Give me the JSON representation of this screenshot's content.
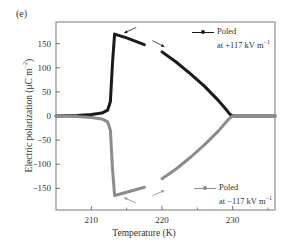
{
  "panel_label": "(e)",
  "chart_data": {
    "type": "line",
    "title": "",
    "xlabel": "Temperature (K)",
    "ylabel": "Electric polarization (μC m⁻²)",
    "xlim": [
      205,
      236
    ],
    "ylim": [
      -195,
      195
    ],
    "xticks": [
      210,
      220,
      230
    ],
    "xticks_minor": [
      215,
      225,
      235
    ],
    "yticks": [
      -150,
      -100,
      -50,
      0,
      50,
      100,
      150
    ],
    "grid": false,
    "legend_position": "inside-right",
    "series": [
      {
        "name": "Poled at +117 kV m⁻¹",
        "color": "#1a1a1a",
        "segments": [
          {
            "label": "cooling (leftward arrow)",
            "x": [
              205,
              208,
              210,
              211.5,
              212.3,
              212.7,
              213.0,
              213.3,
              215,
              217.5
            ],
            "y": [
              0,
              1,
              3,
              6,
              12,
              30,
              110,
              170,
              162,
              148
            ]
          },
          {
            "label": "heating (rightward arrow)",
            "x": [
              220,
              222,
              224,
              226,
              228,
              229,
              229.6,
              230,
              232,
              236
            ],
            "y": [
              133,
              112,
              88,
              62,
              32,
              15,
              4,
              0,
              0,
              0
            ]
          }
        ]
      },
      {
        "name": "Poled at −117 kV m⁻¹",
        "color": "#8c8c8c",
        "segments": [
          {
            "label": "cooling (leftward arrow)",
            "x": [
              205,
              208,
              210,
              211.5,
              212.3,
              212.7,
              213.0,
              213.3,
              215,
              217.5
            ],
            "y": [
              0,
              -1,
              -3,
              -6,
              -12,
              -30,
              -110,
              -165,
              -158,
              -148
            ]
          },
          {
            "label": "heating (rightward arrow)",
            "x": [
              220,
              222,
              224,
              226,
              228,
              229,
              229.6,
              230,
              232,
              236
            ],
            "y": [
              -130,
              -110,
              -86,
              -60,
              -31,
              -14,
              -4,
              0,
              0,
              0
            ]
          }
        ]
      }
    ],
    "annotations": [
      {
        "type": "arrow",
        "direction": "left",
        "near": {
          "x": 215.5,
          "y": 178
        },
        "series": "positive"
      },
      {
        "type": "arrow",
        "direction": "right",
        "near": {
          "x": 219.5,
          "y": 150
        },
        "series": "positive"
      },
      {
        "type": "arrow",
        "direction": "left",
        "near": {
          "x": 215.5,
          "y": -175
        },
        "series": "negative"
      },
      {
        "type": "arrow",
        "direction": "right",
        "near": {
          "x": 219.5,
          "y": -160
        },
        "series": "negative"
      }
    ]
  },
  "legend": {
    "positive": {
      "line1": "Poled",
      "line2": "at +117 kV m",
      "exp": "−1"
    },
    "negative": {
      "line1": "Poled",
      "line2": "at −117 kV m",
      "exp": "−1"
    }
  },
  "axis": {
    "xlabel": "Temperature (K)",
    "ylabel_main": "Electric polarization (μC m",
    "ylabel_exp": "−2",
    "ylabel_tail": ")"
  },
  "layout": {
    "plot": {
      "left": 56,
      "top": 22,
      "right": 275,
      "bottom": 210
    },
    "colors": {
      "frame": "#555555",
      "positive": "#1a1a1a",
      "negative": "#8c8c8c",
      "text": "#333333"
    }
  }
}
